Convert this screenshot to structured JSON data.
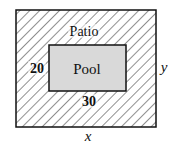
{
  "diagram": {
    "outer_label": "Patio",
    "inner_label": "Pool",
    "inner_height_label": "20",
    "inner_width_label": "30",
    "outer_width_label": "x",
    "outer_height_label": "y",
    "colors": {
      "outline": "#111111",
      "hatch": "#222222",
      "pool_fill": "#d9d9d9",
      "background": "#ffffff"
    }
  }
}
